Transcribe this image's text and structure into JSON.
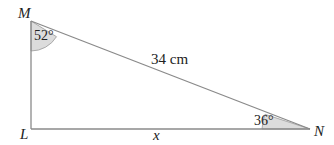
{
  "diagram": {
    "type": "right-triangle",
    "vertices": {
      "M": {
        "label": "M"
      },
      "L": {
        "label": "L"
      },
      "N": {
        "label": "N"
      }
    },
    "angles": {
      "M": "52°",
      "N": "36°"
    },
    "sides": {
      "hypotenuse_MN": "34 cm",
      "base_LN": "x"
    },
    "colors": {
      "stroke": "#8a8a8a",
      "angle_fill": "#d9d9d9",
      "text": "#222222"
    }
  }
}
